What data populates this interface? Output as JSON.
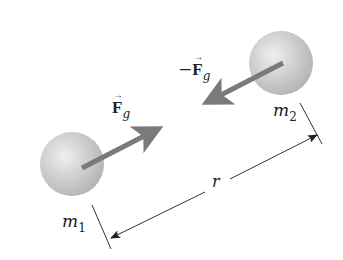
{
  "figure": {
    "mass1": {
      "symbol": "m",
      "subscript": "1"
    },
    "mass2": {
      "symbol": "m",
      "subscript": "2"
    },
    "force1": {
      "sign": "",
      "symbol": "F",
      "subscript": "g"
    },
    "force2": {
      "sign": "−",
      "symbol": "F",
      "subscript": "g"
    },
    "distance": {
      "symbol": "r"
    }
  },
  "colors": {
    "sphere": "#c8c8c8",
    "arrow": "#7a7a7a",
    "line": "#333333"
  }
}
